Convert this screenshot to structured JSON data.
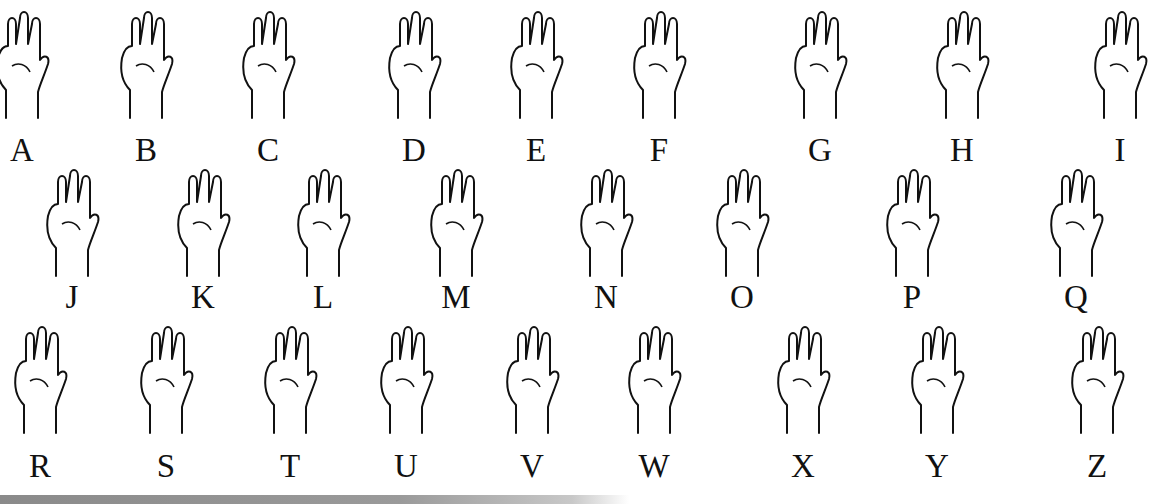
{
  "chart": {
    "rows": [
      {
        "letters": [
          {
            "letter": "A",
            "x": 22,
            "hand": "fist-thumb-side"
          },
          {
            "letter": "B",
            "x": 146,
            "hand": "flat-hand-thumb-across"
          },
          {
            "letter": "C",
            "x": 268,
            "hand": "curved-c-hand"
          },
          {
            "letter": "D",
            "x": 414,
            "hand": "index-up"
          },
          {
            "letter": "E",
            "x": 536,
            "hand": "curled-fingers"
          },
          {
            "letter": "F",
            "x": 659,
            "hand": "ok-three-up"
          },
          {
            "letter": "G",
            "x": 820,
            "hand": "index-point-side"
          },
          {
            "letter": "H",
            "x": 962,
            "hand": "two-fingers-side"
          },
          {
            "letter": "I",
            "x": 1120,
            "hand": "pinky-up"
          }
        ]
      },
      {
        "letters": [
          {
            "letter": "J",
            "x": 72,
            "hand": "pinky-hook-arrow"
          },
          {
            "letter": "K",
            "x": 203,
            "hand": "v-thumb-between"
          },
          {
            "letter": "L",
            "x": 323,
            "hand": "l-shape"
          },
          {
            "letter": "M",
            "x": 456,
            "hand": "three-over-thumb"
          },
          {
            "letter": "N",
            "x": 606,
            "hand": "two-over-thumb"
          },
          {
            "letter": "O",
            "x": 742,
            "hand": "o-shape"
          },
          {
            "letter": "P",
            "x": 912,
            "hand": "k-pointing-down"
          },
          {
            "letter": "Q",
            "x": 1076,
            "hand": "g-pointing-down"
          }
        ]
      },
      {
        "letters": [
          {
            "letter": "R",
            "x": 40,
            "hand": "crossed-fingers"
          },
          {
            "letter": "S",
            "x": 166,
            "hand": "fist-thumb-front"
          },
          {
            "letter": "T",
            "x": 290,
            "hand": "thumb-under-index"
          },
          {
            "letter": "U",
            "x": 406,
            "hand": "two-fingers-together"
          },
          {
            "letter": "V",
            "x": 532,
            "hand": "v-sign"
          },
          {
            "letter": "W",
            "x": 654,
            "hand": "three-fingers"
          },
          {
            "letter": "X",
            "x": 803,
            "hand": "hooked-index"
          },
          {
            "letter": "Y",
            "x": 937,
            "hand": "thumb-pinky-out"
          },
          {
            "letter": "Z",
            "x": 1097,
            "hand": "index-trace-z"
          }
        ]
      }
    ],
    "row_letter_y": [
      150,
      297,
      466
    ],
    "row_hand_y": [
      10,
      168,
      325
    ]
  },
  "colors": {
    "ink": "#111111",
    "background": "#ffffff",
    "band": "#8a8a8a"
  }
}
